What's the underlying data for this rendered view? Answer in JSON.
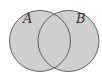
{
  "diagram": {
    "type": "venn",
    "sets": [
      {
        "label": "A",
        "cx": 40,
        "cy": 41,
        "r": 30.5
      },
      {
        "label": "B",
        "cx": 68.5,
        "cy": 41,
        "r": 30.5
      }
    ],
    "fill_color": "#cfcfcf",
    "stroke_color": "#555555",
    "shaded_region": "A ∪ B"
  }
}
